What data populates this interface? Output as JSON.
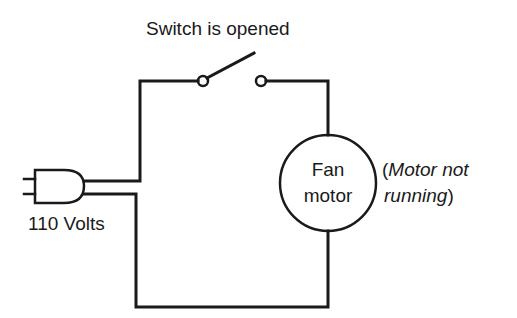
{
  "diagram": {
    "title": "Switch is opened",
    "power_source": {
      "label": "110 Volts",
      "icon": "plug-icon"
    },
    "switch": {
      "state": "open"
    },
    "load": {
      "label_line1": "Fan",
      "label_line2": "motor"
    },
    "status_note": {
      "open_paren": "(",
      "line1": "Motor not",
      "line2": "running",
      "close_paren": ")"
    },
    "colors": {
      "line": "#1a1a1a",
      "background": "#ffffff"
    }
  }
}
